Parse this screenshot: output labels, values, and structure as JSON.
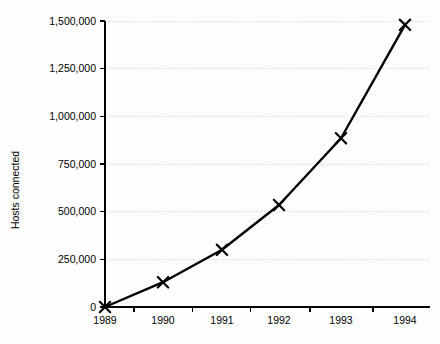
{
  "chart_data": {
    "type": "line",
    "title": "",
    "xlabel": "",
    "ylabel": "Hosts connected",
    "categories": [
      "1989",
      "1990",
      "1991",
      "1992",
      "1993",
      "1994"
    ],
    "values": [
      0,
      130000,
      300000,
      535000,
      885000,
      1480000
    ],
    "series": [
      {
        "name": "Hosts connected",
        "values": [
          0,
          130000,
          300000,
          535000,
          885000,
          1480000
        ]
      }
    ],
    "ylim": [
      0,
      1500000
    ],
    "y_ticks": [
      0,
      250000,
      500000,
      750000,
      1000000,
      1250000,
      1500000
    ],
    "y_tick_labels": [
      "0",
      "250,000",
      "500,000",
      "750,000",
      "1,000,000",
      "1,250,000",
      "1,500,000"
    ],
    "x_tick_labels": [
      "1989",
      "1990",
      "1991",
      "1992",
      "1993",
      "1994"
    ],
    "grid": true,
    "grid_axis": "y",
    "legend": "none",
    "marker": "x",
    "line_color": "#000000",
    "grid_color": "#d8d8d8",
    "axis_color": "#000000",
    "background_color": "#fefefe"
  }
}
